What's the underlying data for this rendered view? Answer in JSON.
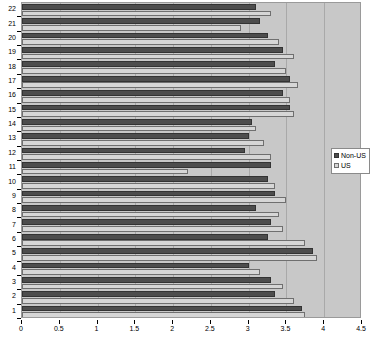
{
  "chart_data": {
    "type": "bar",
    "orientation": "horizontal",
    "title": "",
    "xlabel": "",
    "ylabel": "",
    "xlim": [
      0,
      4.5
    ],
    "xticks": [
      "0",
      "0.5",
      "1",
      "1.5",
      "2",
      "2.5",
      "3",
      "3.5",
      "4",
      "4.5"
    ],
    "xtick_values": [
      0,
      0.5,
      1,
      1.5,
      2,
      2.5,
      3,
      3.5,
      4,
      4.5
    ],
    "grid": true,
    "grid_axis": "x",
    "legend_position": "right",
    "categories": [
      "1",
      "2",
      "3",
      "4",
      "5",
      "6",
      "7",
      "8",
      "9",
      "10",
      "11",
      "12",
      "13",
      "14",
      "15",
      "16",
      "17",
      "18",
      "19",
      "20",
      "21",
      "22"
    ],
    "series": [
      {
        "name": "Non-US",
        "color": "#4d4d4d",
        "values": [
          3.7,
          3.35,
          3.3,
          3.0,
          3.85,
          3.25,
          3.3,
          3.1,
          3.35,
          3.25,
          3.3,
          2.95,
          3.0,
          3.05,
          3.55,
          3.45,
          3.55,
          3.35,
          3.45,
          3.25,
          3.15,
          3.1
        ]
      },
      {
        "name": "US",
        "color": "#d6d6d6",
        "values": [
          3.75,
          3.6,
          3.45,
          3.15,
          3.9,
          3.75,
          3.45,
          3.4,
          3.5,
          3.35,
          2.2,
          3.3,
          3.2,
          3.1,
          3.6,
          3.55,
          3.65,
          3.5,
          3.6,
          3.4,
          2.9,
          3.3
        ]
      }
    ]
  },
  "legend": {
    "items": [
      {
        "label": "Non-US"
      },
      {
        "label": "US"
      }
    ]
  }
}
